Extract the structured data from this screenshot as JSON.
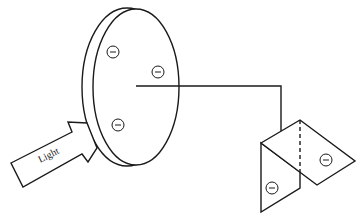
{
  "diagram": {
    "type": "electroscope-photoelectric-effect",
    "arrow": {
      "label": "Light"
    },
    "disc": {
      "charges": [
        "−",
        "−",
        "−"
      ]
    },
    "leaves": {
      "charges": [
        "−",
        "−"
      ]
    },
    "colors": {
      "stroke": "#1a1a1a",
      "background": "#ffffff"
    }
  }
}
